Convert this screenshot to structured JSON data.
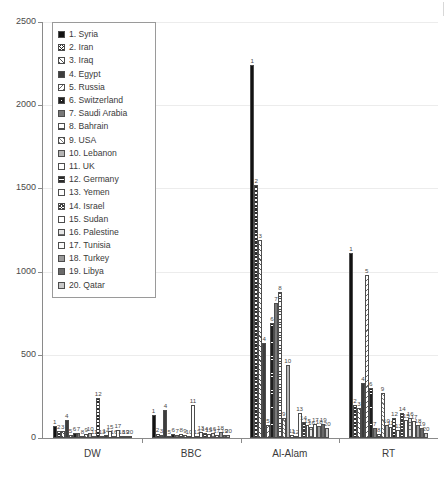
{
  "chart_data": {
    "type": "bar",
    "title": "",
    "xlabel": "",
    "ylabel": "",
    "ylim": [
      0,
      2500
    ],
    "ytick_labels": [
      "0",
      "500",
      "1000",
      "1500",
      "2000",
      "2500"
    ],
    "ytick_values": [
      0,
      500,
      1000,
      1500,
      2000,
      2500
    ],
    "grid": true,
    "legend_position": "upper-left",
    "categories": [
      "DW",
      "BBC",
      "Al-Alam",
      "RT"
    ],
    "legend": [
      "1. Syria",
      "2. Iran",
      "3. Iraq",
      "4. Egypt",
      "5. Russia",
      "6. Switzerland",
      "7. Saudi Arabia",
      "8. Bahrain",
      "9. USA",
      "10. Lebanon",
      "11. UK",
      "12. Germany",
      "13. Yemen",
      "14. Israel",
      "15. Sudan",
      "16. Palestine",
      "17. Tunisia",
      "18. Turkey",
      "19. Libya",
      "20. Qatar"
    ],
    "series": [
      {
        "name": "1. Syria",
        "values": [
          72,
          140,
          2240,
          1110
        ]
      },
      {
        "name": "2. Iran",
        "values": [
          40,
          22,
          1520,
          200
        ]
      },
      {
        "name": "3. Iraq",
        "values": [
          44,
          16,
          1190,
          180
        ]
      },
      {
        "name": "4. Egypt",
        "values": [
          110,
          170,
          570,
          330
        ]
      },
      {
        "name": "5. Russia",
        "values": [
          20,
          14,
          80,
          980
        ]
      },
      {
        "name": "6. Switzerland",
        "values": [
          30,
          26,
          690,
          300
        ]
      },
      {
        "name": "7. Saudi Arabia",
        "values": [
          30,
          20,
          810,
          60
        ]
      },
      {
        "name": "8. Bahrain",
        "values": [
          10,
          26,
          880,
          26
        ]
      },
      {
        "name": "9. USA",
        "values": [
          26,
          18,
          120,
          270
        ]
      },
      {
        "name": "10. Lebanon",
        "values": [
          30,
          14,
          440,
          80
        ]
      },
      {
        "name": "11. UK",
        "values": [
          14,
          200,
          20,
          66
        ]
      },
      {
        "name": "12. Germany",
        "values": [
          240,
          14,
          12,
          120
        ]
      },
      {
        "name": "13. Yemen",
        "values": [
          14,
          36,
          150,
          46
        ]
      },
      {
        "name": "14. Israel",
        "values": [
          16,
          30,
          96,
          150
        ]
      },
      {
        "name": "15. Sudan",
        "values": [
          44,
          22,
          80,
          110
        ]
      },
      {
        "name": "16. Palestine",
        "values": [
          12,
          30,
          64,
          120
        ]
      },
      {
        "name": "17. Tunisia",
        "values": [
          46,
          20,
          84,
          104
        ]
      },
      {
        "name": "18. Turkey",
        "values": [
          10,
          34,
          72,
          80
        ]
      },
      {
        "name": "19. Libya",
        "values": [
          8,
          20,
          86,
          60
        ]
      },
      {
        "name": "20. Qatar",
        "values": [
          8,
          16,
          60,
          30
        ]
      }
    ],
    "bar_labels": [
      "1",
      "2",
      "3",
      "4",
      "5",
      "6",
      "7",
      "8",
      "9",
      "10",
      "11",
      "12",
      "13",
      "14",
      "15",
      "16",
      "17",
      "18",
      "19",
      "20"
    ]
  }
}
